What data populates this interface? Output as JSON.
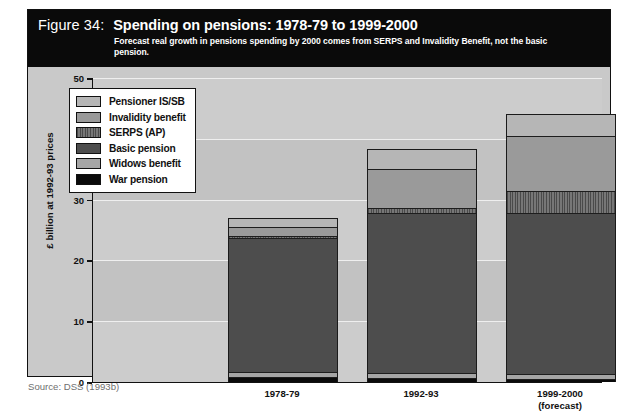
{
  "figure": {
    "number": "Figure 34:",
    "title": "Spending on pensions: 1978-79 to 1999-2000",
    "subtitle": "Forecast real growth in pensions spending by 2000 comes from SERPS and Invalidity Benefit, not the basic pension.",
    "source": "Source: DSS (1993b)"
  },
  "colors": {
    "title_band": "#0a0a0a",
    "plot_background": "#c2c2c2",
    "gridline": "#efefef",
    "pensioner_is_sb": "#b6b6b6",
    "invalidity_benefit": "#9a9a9a",
    "serps_ap": "#5a5a5a",
    "basic_pension": "#4d4d4d",
    "widows_benefit": "#a5a5a5",
    "war_pension": "#0b0b0b"
  },
  "legend": {
    "position": "inside-top-left",
    "items": [
      {
        "label": "Pensioner IS/SB",
        "swatch": "f-isb"
      },
      {
        "label": "Invalidity benefit",
        "swatch": "f-inv"
      },
      {
        "label": "SERPS (AP)",
        "swatch": "f-serps"
      },
      {
        "label": "Basic pension",
        "swatch": "f-basic"
      },
      {
        "label": "Widows benefit",
        "swatch": "f-widows"
      },
      {
        "label": "War pension",
        "swatch": "f-war"
      }
    ]
  },
  "chart_data": {
    "type": "bar",
    "subtype": "stacked-vertical",
    "title": "Spending on pensions: 1978-79 to 1999-2000",
    "subtitle": "Forecast real growth in pensions spending by 2000 comes from SERPS and Invalidity Benefit, not the basic pension.",
    "xlabel": "",
    "ylabel": "£ billion at 1992-93 prices",
    "ylim": [
      0,
      50
    ],
    "yticks": [
      0,
      10,
      20,
      30,
      40,
      50
    ],
    "ytick_labels": [
      "0",
      "10",
      "20",
      "30",
      "40",
      "50"
    ],
    "grid": true,
    "legend_position": "inside-top-left",
    "categories": [
      "1978-79",
      "1992-93",
      "1999-2000"
    ],
    "category_labels": [
      {
        "line1": "1978-79",
        "line2": ""
      },
      {
        "line1": "1992-93",
        "line2": ""
      },
      {
        "line1": "1999-2000",
        "line2": "(forecast)"
      }
    ],
    "stack_order_bottom_to_top": [
      "War pension",
      "Widows benefit",
      "Basic pension",
      "SERPS (AP)",
      "Invalidity benefit",
      "Pensioner IS/SB"
    ],
    "series": [
      {
        "name": "War pension",
        "values": [
          0.7,
          0.5,
          0.4
        ]
      },
      {
        "name": "Widows benefit",
        "values": [
          0.8,
          0.9,
          0.8
        ]
      },
      {
        "name": "Basic pension",
        "values": [
          22.2,
          26.4,
          26.6
        ]
      },
      {
        "name": "SERPS (AP)",
        "values": [
          0.3,
          0.7,
          3.6
        ]
      },
      {
        "name": "Invalidity benefit",
        "values": [
          1.5,
          6.6,
          9.1
        ]
      },
      {
        "name": "Pensioner IS/SB",
        "values": [
          1.5,
          3.2,
          3.5
        ]
      }
    ],
    "totals": [
      27.0,
      38.3,
      44.0
    ],
    "units": "£ billion at 1992-93 prices"
  }
}
